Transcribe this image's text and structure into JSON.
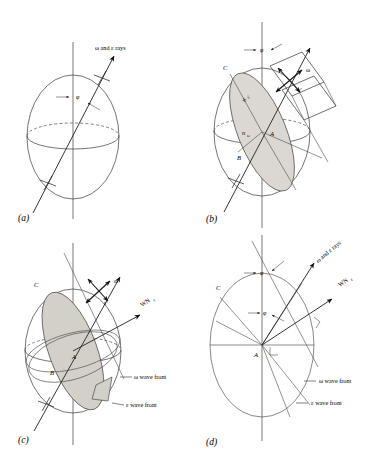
{
  "figure": {
    "background": "#ffffff",
    "shade_color": "#dbd8d3",
    "line_color": "#3a3a3a"
  },
  "panels": [
    {
      "id": "a",
      "letter": "(a)",
      "caption": "Indicatrix with ray along optic axis direction",
      "labels": {
        "rays": "ω and ε rays",
        "angle": "φ"
      }
    },
    {
      "id": "b",
      "letter": "(b)",
      "caption": "Elliptical section with principal indices",
      "labels": {
        "angle": "φ",
        "omega_vib": "ω",
        "epsilon_vib": "ε'",
        "n_epsilon": "n",
        "n_epsilon_sub": "ε'",
        "n_omega": "n",
        "n_omega_sub": "ω",
        "point_a": "A",
        "point_b": "B",
        "point_c": "C",
        "rays": "rays"
      }
    },
    {
      "id": "c",
      "letter": "(c)",
      "caption": "Wave fronts tangent to the indicatrix",
      "labels": {
        "omega_vib": "ω",
        "epsilon_vib": "ε'",
        "wave_normal": "WN",
        "wave_normal_sub": "ε",
        "omega_front": "ω wave front",
        "epsilon_front": "ε wave front",
        "point_a": "A",
        "point_b": "B",
        "point_c": "C"
      }
    },
    {
      "id": "d",
      "letter": "(d)",
      "caption": "Principal section showing ray and wave normal separation",
      "labels": {
        "angle_top": "φ",
        "angle_inner": "φ",
        "rays": "ω and ε rays",
        "wave_normal": "WN",
        "wave_normal_sub": "ε",
        "omega_front": "ω wave front",
        "epsilon_front": "ε wave front",
        "point_a": "A",
        "point_c": "C"
      }
    }
  ]
}
